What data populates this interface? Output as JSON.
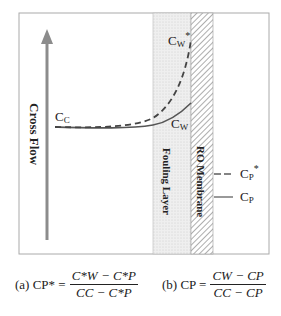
{
  "diagram": {
    "flow_label": "Cross Flow",
    "fouling_label": "Fouling Layer",
    "membrane_label": "RO Membrane",
    "labels": {
      "cc": "C",
      "cc_sub": "C",
      "cw_star": "C",
      "cw_star_sub": "W",
      "cw_star_sup": "*",
      "cw": "C",
      "cw_sub": "W",
      "cp_star": "C",
      "cp_star_sub": "P",
      "cp_star_sup": "*",
      "cp": "C",
      "cp_sub": "P"
    },
    "colors": {
      "arrow": "#8c8c8c",
      "curve": "#555555",
      "fouling": "#ececec",
      "border": "#999999"
    }
  },
  "equations": {
    "a": {
      "prefix": "(a) CP* =",
      "num": "C*W − C*P",
      "den": "CC − C*P"
    },
    "b": {
      "prefix": "(b) CP =",
      "num": "CW − CP",
      "den": "CC − CP"
    }
  }
}
